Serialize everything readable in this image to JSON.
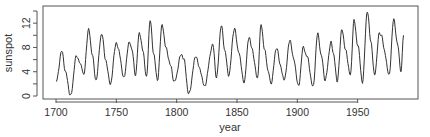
{
  "chart_data": {
    "type": "line",
    "title": "",
    "xlabel": "year",
    "ylabel": "sunspot",
    "xlim": [
      1700,
      1988
    ],
    "ylim": [
      0,
      14
    ],
    "grid": false,
    "legend": null,
    "x_ticks": [
      1700,
      1750,
      1800,
      1850,
      1900,
      1950
    ],
    "x_tick_labels": [
      "1700",
      "1750",
      "1800",
      "1850",
      "1900",
      "1950"
    ],
    "y_ticks": [
      0,
      2,
      4,
      6,
      8,
      10,
      12,
      14
    ],
    "y_tick_labels": [
      "0",
      "",
      "4",
      "",
      "8",
      "",
      "12",
      ""
    ],
    "series": [
      {
        "name": "sunspot",
        "color": "#333333",
        "x_start": 1700,
        "x_step": 1,
        "keypoints": [
          [
            1700,
            2.3
          ],
          [
            1705,
            7.4
          ],
          [
            1708,
            3.8
          ],
          [
            1712,
            0.0
          ],
          [
            1717,
            6.6
          ],
          [
            1721,
            5.0
          ],
          [
            1723,
            3.5
          ],
          [
            1727,
            11.0
          ],
          [
            1730,
            7.0
          ],
          [
            1733,
            2.6
          ],
          [
            1738,
            10.3
          ],
          [
            1741,
            6.0
          ],
          [
            1745,
            2.0
          ],
          [
            1750,
            8.8
          ],
          [
            1752,
            7.5
          ],
          [
            1756,
            3.0
          ],
          [
            1761,
            9.0
          ],
          [
            1763,
            7.5
          ],
          [
            1766,
            3.4
          ],
          [
            1769,
            10.5
          ],
          [
            1772,
            7.5
          ],
          [
            1775,
            3.0
          ],
          [
            1778,
            12.5
          ],
          [
            1781,
            7.0
          ],
          [
            1784,
            2.6
          ],
          [
            1788,
            11.8
          ],
          [
            1791,
            8.0
          ],
          [
            1795,
            5.0
          ],
          [
            1798,
            2.3
          ],
          [
            1804,
            6.9
          ],
          [
            1806,
            6.0
          ],
          [
            1810,
            0.3
          ],
          [
            1816,
            6.6
          ],
          [
            1819,
            4.5
          ],
          [
            1823,
            1.6
          ],
          [
            1830,
            8.4
          ],
          [
            1833,
            3.0
          ],
          [
            1837,
            11.6
          ],
          [
            1840,
            7.5
          ],
          [
            1843,
            3.4
          ],
          [
            1848,
            11.2
          ],
          [
            1851,
            7.5
          ],
          [
            1856,
            2.3
          ],
          [
            1860,
            9.8
          ],
          [
            1862,
            8.0
          ],
          [
            1867,
            3.0
          ],
          [
            1870,
            11.8
          ],
          [
            1873,
            7.5
          ],
          [
            1876,
            4.0
          ],
          [
            1878,
            2.0
          ],
          [
            1883,
            8.0
          ],
          [
            1886,
            5.0
          ],
          [
            1889,
            2.6
          ],
          [
            1894,
            9.2
          ],
          [
            1897,
            6.0
          ],
          [
            1901,
            1.6
          ],
          [
            1905,
            8.0
          ],
          [
            1908,
            6.5
          ],
          [
            1913,
            1.5
          ],
          [
            1917,
            10.3
          ],
          [
            1920,
            6.5
          ],
          [
            1923,
            2.6
          ],
          [
            1928,
            8.8
          ],
          [
            1930,
            7.0
          ],
          [
            1933,
            2.4
          ],
          [
            1937,
            11.0
          ],
          [
            1940,
            7.5
          ],
          [
            1944,
            3.4
          ],
          [
            1947,
            12.5
          ],
          [
            1950,
            8.5
          ],
          [
            1954,
            2.3
          ],
          [
            1958,
            14.0
          ],
          [
            1961,
            9.0
          ],
          [
            1964,
            3.4
          ],
          [
            1968,
            10.3
          ],
          [
            1970,
            10.0
          ],
          [
            1972,
            7.5
          ],
          [
            1976,
            3.4
          ],
          [
            1980,
            12.6
          ],
          [
            1983,
            8.5
          ],
          [
            1986,
            4.0
          ],
          [
            1988,
            10.0
          ]
        ]
      }
    ]
  }
}
